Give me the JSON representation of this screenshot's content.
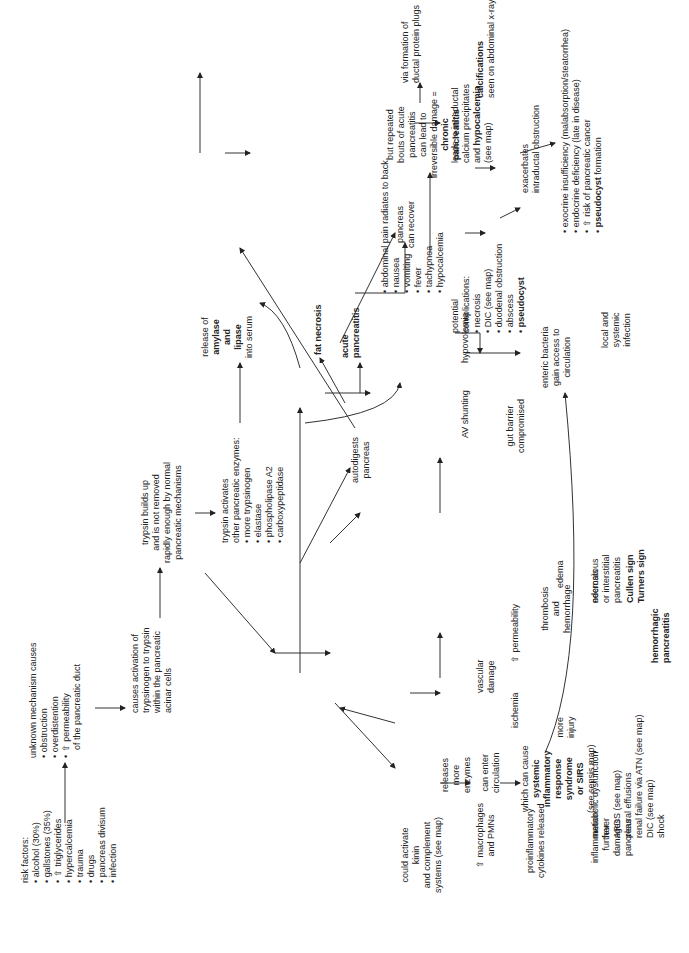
{
  "diagram": {
    "orientation": "rotated 90 degrees counter-clockwise",
    "nodes": {
      "risk_factors": {
        "heading": "risk factors:",
        "items": [
          "alcohol (30%)",
          "gallstones (35%)",
          "⇧ triglycerides",
          "hypercalcemia",
          "trauma",
          "drugs",
          "pancreas divisum",
          "infection"
        ]
      },
      "unknown_mechanism": {
        "heading": "unknown mechanism causes",
        "items": [
          "obstruction",
          "overdistention",
          "⇧ permeability"
        ],
        "tail": "of the pancreatic duct"
      },
      "activation": {
        "lines": [
          "causes activation of",
          "trypsinogen to trypsin",
          "within the pancreatic",
          "acinar cells"
        ]
      },
      "trypsin_builds": {
        "lines": [
          "trypsin builds up",
          "and is not removed",
          "rapidly enough by normal",
          "pancreatic mechanisms"
        ]
      },
      "trypsin_activates": {
        "heading": "trypsin activates",
        "heading2": "other pancreatic enzymes:",
        "items": [
          "more trypsinogen",
          "elastase",
          "phospholipase A2",
          "carboxypeptidase"
        ]
      },
      "release_amylase": {
        "line1": "release of",
        "bold1": "amylase",
        "bold2": "and",
        "bold3": "lipase",
        "line2": "into serum"
      },
      "autodigests": {
        "lines": [
          "autodigests",
          "pancreas"
        ]
      },
      "fat_necrosis": {
        "label": "fat necrosis"
      },
      "acute_pancreatitis": {
        "lines": [
          "acute",
          "pancreatitis"
        ]
      },
      "symptoms": {
        "items": [
          "abdominal pain radiates to back",
          "nausea",
          "vomiting",
          "fever",
          "tachypnea",
          "hypocalcemia"
        ]
      },
      "pancreas_recover": {
        "lines": [
          "pancreas",
          "can recover"
        ]
      },
      "repeated_bouts": {
        "lines": [
          "but repeated",
          "bouts of acute",
          "pancreatitis",
          "can lead to",
          "irreversible damage ="
        ],
        "bold": [
          "chronic",
          "pancreatitis"
        ]
      },
      "ductal_plugs": {
        "lines": [
          "via formation of",
          "ductal protein plugs"
        ]
      },
      "calcium_precip": {
        "lines": [
          "leads to intraductal",
          "calcium precipitates"
        ],
        "bold_prefix": "and ",
        "bold": "hypocalcemia",
        "tail": "(see map)"
      },
      "calcifications": {
        "bold": "calcifications",
        "line": "seen on abdominal x-ray"
      },
      "exacerbates": {
        "lines": [
          "exacerbates",
          "intraductal obstruction"
        ]
      },
      "chronic_outcomes": {
        "items": [
          "exocrine insufficiency (malabsorption/steatorrhea)",
          "endocrine deficiency (late in disease)",
          "⇧ risk of pancreatic cancer"
        ],
        "bold_item": "pseudocyst",
        "bold_item_tail": " formation"
      },
      "potential_complications": {
        "heading": [
          "potential",
          "complications:"
        ],
        "items": [
          "necrosis",
          "DIC (see map)",
          "duodenal obstruction",
          "abscess"
        ],
        "bold_item": "pseudocyst"
      },
      "av_shunting": {
        "label": "AV shunting"
      },
      "hypovolemia": {
        "label": "hypovolemia"
      },
      "gut_barrier": {
        "lines": [
          "gut barrier",
          "compromised"
        ]
      },
      "enteric_bacteria": {
        "lines": [
          "enteric bacteria",
          "gain access to",
          "circulation"
        ]
      },
      "local_systemic": {
        "lines": [
          "local and",
          "systemic",
          "infection"
        ]
      },
      "edema": {
        "label": "edema"
      },
      "edematous": {
        "lines": [
          "edematous",
          "or interstitial",
          "pancreatitis"
        ]
      },
      "permeability": {
        "label": "⇧ permeability"
      },
      "vascular_damage": {
        "lines": [
          "vascular",
          "damage"
        ]
      },
      "thrombosis": {
        "lines": [
          "thrombosis",
          "and",
          "hemorrhage"
        ]
      },
      "necrosis": {
        "label": "necrosis"
      },
      "cullen": {
        "lines": [
          "Cullen sign",
          "Turners sign"
        ]
      },
      "hemorrhagic": {
        "lines": [
          "hemorrhagic",
          "pancreatitis"
        ]
      },
      "ischemia": {
        "label": "ischemia"
      },
      "more_injury": {
        "lines": [
          "more",
          "injury"
        ]
      },
      "releases_enzymes": {
        "lines": [
          "releases",
          "more",
          "enzymes"
        ]
      },
      "can_enter": {
        "lines": [
          "can enter",
          "circulation"
        ]
      },
      "sirs": {
        "line1": "which can cause",
        "bold": [
          "systemic",
          "inflammatory",
          "response",
          "syndrome",
          "or SIRS"
        ],
        "tail": "(see sepsis map)"
      },
      "sirs_effects": {
        "items": [
          "metabolic dysfunction",
          "fever",
          "ARDS (see map)",
          "pleural effusions",
          "renal failure via ATN (see map)",
          "DIC (see map)",
          "shock"
        ]
      },
      "kinin": {
        "lines": [
          "could activate",
          "kinin",
          "and complement",
          "systems (see map)"
        ]
      },
      "macrophages": {
        "lines": [
          "⇧ macrophages",
          "and PMNs"
        ]
      },
      "cytokines": {
        "lines": [
          "proinflammatory",
          "cytokines released"
        ]
      },
      "inflammation": {
        "lines": [
          "inflammation",
          "further",
          "damages",
          "pancreas"
        ]
      }
    }
  }
}
